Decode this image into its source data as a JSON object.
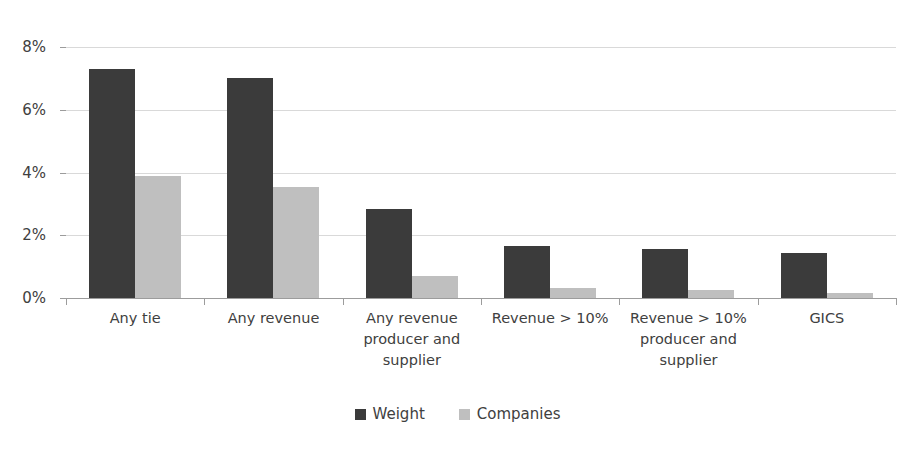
{
  "chart_data": {
    "type": "bar",
    "title": "",
    "xlabel": "",
    "ylabel": "",
    "ylim": [
      0,
      8
    ],
    "ytick_values": [
      0,
      2,
      4,
      6,
      8
    ],
    "ytick_labels": [
      "0%",
      "2%",
      "4%",
      "6%",
      "8%"
    ],
    "grid": true,
    "legend_position": "bottom",
    "categories": [
      "Any tie",
      "Any revenue",
      "Any revenue producer and supplier",
      "Revenue > 10%",
      "Revenue > 10% producer and supplier",
      "GICS"
    ],
    "category_lines": [
      [
        "Any tie"
      ],
      [
        "Any revenue"
      ],
      [
        "Any revenue",
        "producer and",
        "supplier"
      ],
      [
        "Revenue > 10%"
      ],
      [
        "Revenue > 10%",
        "producer and",
        "supplier"
      ],
      [
        "GICS"
      ]
    ],
    "series": [
      {
        "name": "Weight",
        "color": "#3b3b3b",
        "values": [
          7.3,
          7.0,
          2.85,
          1.65,
          1.55,
          1.45
        ]
      },
      {
        "name": "Companies",
        "color": "#bfbfbf",
        "values": [
          3.9,
          3.55,
          0.7,
          0.32,
          0.25,
          0.15
        ]
      }
    ]
  },
  "legend": {
    "items": [
      {
        "label": "Weight",
        "swatch": "weight-swatch-icon"
      },
      {
        "label": "Companies",
        "swatch": "companies-swatch-icon"
      }
    ]
  }
}
